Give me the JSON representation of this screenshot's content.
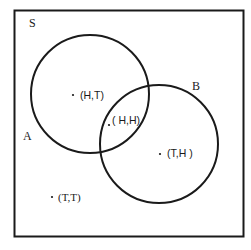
{
  "diagram": {
    "type": "venn",
    "universe_label": "S",
    "sets": [
      {
        "id": "A",
        "label": "A"
      },
      {
        "id": "B",
        "label": "B"
      }
    ],
    "elements": [
      {
        "label": "(H,T)",
        "region": "A only"
      },
      {
        "label": "( H,H)",
        "region": "A and B"
      },
      {
        "label": "(T,H )",
        "region": "B only"
      },
      {
        "label": "(T,T)",
        "region": "outside A and B"
      }
    ],
    "colors": {
      "stroke": "#1a1a1a",
      "background": "#ffffff"
    }
  }
}
